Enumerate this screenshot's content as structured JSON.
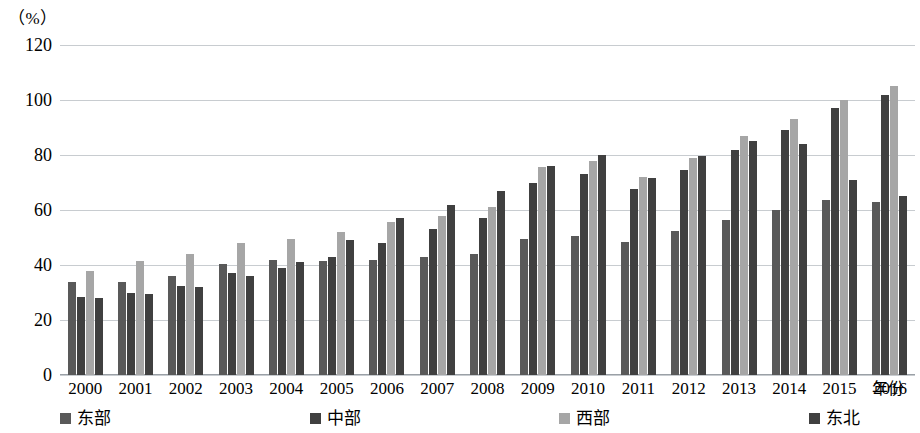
{
  "chart_data": {
    "type": "bar",
    "title": "",
    "subtitle": "",
    "unit_label": "（%）",
    "xlabel": "年份",
    "ylabel": "",
    "ylim": [
      0,
      120
    ],
    "yticks": [
      0,
      20,
      40,
      60,
      80,
      100,
      120
    ],
    "grid": true,
    "legend_position": "bottom",
    "categories": [
      "2000",
      "2001",
      "2002",
      "2003",
      "2004",
      "2005",
      "2006",
      "2007",
      "2008",
      "2009",
      "2010",
      "2011",
      "2012",
      "2013",
      "2014",
      "2015",
      "2016"
    ],
    "series": [
      {
        "name": "东部",
        "color": "#595959",
        "values": [
          34.0,
          34.0,
          36.0,
          40.5,
          42.0,
          41.5,
          42.0,
          43.0,
          44.0,
          49.5,
          50.5,
          48.5,
          52.5,
          56.5,
          60.0,
          63.5,
          63.0
        ]
      },
      {
        "name": "中部",
        "color": "#404040",
        "values": [
          28.5,
          30.0,
          32.5,
          37.0,
          39.0,
          43.0,
          48.0,
          53.0,
          57.0,
          70.0,
          73.0,
          67.5,
          74.5,
          82.0,
          89.0,
          97.0,
          102.0
        ]
      },
      {
        "name": "西部",
        "color": "#a6a6a6",
        "values": [
          38.0,
          41.5,
          44.0,
          48.0,
          49.5,
          52.0,
          55.5,
          58.0,
          61.0,
          75.5,
          78.0,
          72.0,
          79.0,
          87.0,
          93.0,
          100.0,
          105.0
        ]
      },
      {
        "name": "东北",
        "color": "#404040",
        "values": [
          28.0,
          29.5,
          32.0,
          36.0,
          41.0,
          49.0,
          57.0,
          62.0,
          67.0,
          76.0,
          80.0,
          71.5,
          79.5,
          85.0,
          84.0,
          71.0,
          65.0
        ]
      }
    ]
  }
}
